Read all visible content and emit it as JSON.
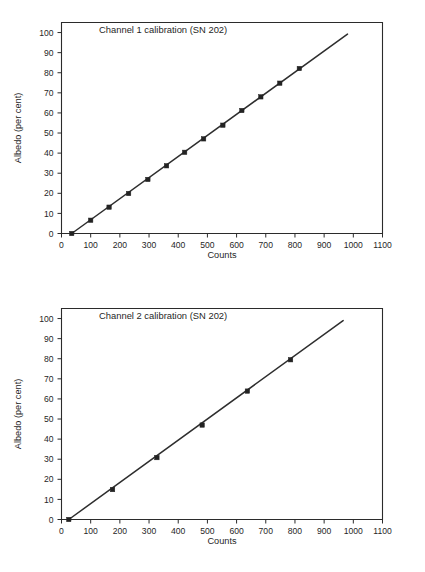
{
  "document": {
    "background_color": "#ffffff",
    "ink_color": "#2b2b2b"
  },
  "figures": [
    {
      "id": "figure-1",
      "title": "Channel 1 calibration (SN 202)",
      "xlabel": "Counts",
      "ylabel": "Albedo (per cent)"
    },
    {
      "id": "figure-2",
      "title": "Channel 2 calibration (SN 202)",
      "xlabel": "Counts",
      "ylabel": "Albedo (per cent)"
    }
  ],
  "chart_data": [
    {
      "type": "scatter",
      "title": "Channel 1 calibration (SN 202)",
      "xlabel": "Counts",
      "ylabel": "Albedo (per cent)",
      "xlim": [
        0,
        1100
      ],
      "ylim": [
        0,
        105
      ],
      "xticks": [
        0,
        100,
        200,
        300,
        400,
        500,
        600,
        700,
        800,
        900,
        1000,
        1100
      ],
      "yticks": [
        0,
        10,
        20,
        30,
        40,
        50,
        60,
        70,
        80,
        90,
        100
      ],
      "grid": false,
      "legend": "none",
      "marker": "square",
      "series": [
        {
          "name": "Channel 1 measurements",
          "x": [
            35,
            100,
            163,
            230,
            296,
            360,
            422,
            487,
            553,
            618,
            683,
            748,
            815
          ],
          "y": [
            0.0,
            6.6,
            13.1,
            19.9,
            26.9,
            33.7,
            40.4,
            47.1,
            53.9,
            61.2,
            68.0,
            74.8,
            82.1
          ]
        },
        {
          "name": "Linear fit",
          "type": "line",
          "x": [
            35,
            980
          ],
          "y": [
            0.0,
            99.2
          ]
        }
      ]
    },
    {
      "type": "scatter",
      "title": "Channel 2 calibration (SN 202)",
      "xlabel": "Counts",
      "ylabel": "Albedo (per cent)",
      "xlim": [
        0,
        1100
      ],
      "ylim": [
        0,
        105
      ],
      "xticks": [
        0,
        100,
        200,
        300,
        400,
        500,
        600,
        700,
        800,
        900,
        1000,
        1100
      ],
      "yticks": [
        0,
        10,
        20,
        30,
        40,
        50,
        60,
        70,
        80,
        90,
        100
      ],
      "grid": false,
      "legend": "none",
      "marker": "square",
      "series": [
        {
          "name": "Channel 2 measurements",
          "x": [
            25,
            175,
            327,
            482,
            637,
            785
          ],
          "y": [
            0.0,
            14.9,
            30.8,
            47.0,
            63.9,
            79.5
          ]
        },
        {
          "name": "Linear fit",
          "type": "line",
          "x": [
            25,
            965
          ],
          "y": [
            0.0,
            99.0
          ]
        }
      ]
    }
  ]
}
